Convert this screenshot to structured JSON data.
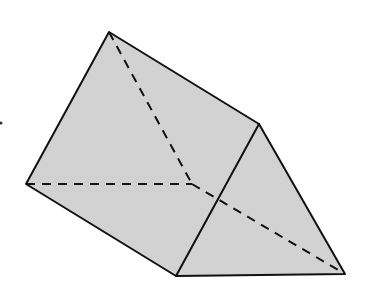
{
  "figure": {
    "type": "triangular-prism",
    "fill_color": "#d2d2d2",
    "edge_color": "#111111",
    "vertices": {
      "top": [
        109,
        32
      ],
      "right_top": [
        259,
        124
      ],
      "left": [
        26,
        184
      ],
      "bottom_mid": [
        176,
        276
      ],
      "bottom_right": [
        345,
        274
      ],
      "hidden": [
        192,
        184
      ]
    },
    "visible_edges": [
      [
        "top",
        "right_top"
      ],
      [
        "top",
        "left"
      ],
      [
        "left",
        "bottom_mid"
      ],
      [
        "right_top",
        "bottom_mid"
      ],
      [
        "right_top",
        "bottom_right"
      ],
      [
        "bottom_mid",
        "bottom_right"
      ]
    ],
    "hidden_edges": [
      [
        "top",
        "hidden"
      ],
      [
        "left",
        "hidden"
      ],
      [
        "hidden",
        "bottom_right"
      ]
    ]
  }
}
